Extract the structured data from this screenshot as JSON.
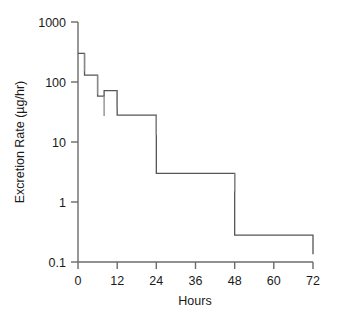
{
  "chart_data": {
    "type": "line",
    "plot_style": "step-post",
    "title": "",
    "subtitle": "",
    "xlabel": "Hours",
    "ylabel": "Excretion Rate (µg/hr)",
    "xlim": [
      0,
      72
    ],
    "ylim": [
      0.1,
      1000
    ],
    "yscale": "log",
    "xscale": "linear",
    "grid": false,
    "legend": null,
    "legend_position": "none",
    "xticks": [
      0,
      12,
      24,
      36,
      48,
      60,
      72
    ],
    "xtick_labels": [
      "0",
      "12",
      "24",
      "36",
      "48",
      "60",
      "72"
    ],
    "yticks": [
      0.1,
      1,
      10,
      100,
      1000
    ],
    "ytick_labels": [
      "0.1",
      "1",
      "10",
      "100",
      "1000"
    ],
    "line_color": "#555555",
    "axis_color": "#6b6b6b",
    "background": "#ffffff",
    "x": [
      0,
      2,
      6,
      8,
      12,
      24,
      48,
      72
    ],
    "intervals": [
      {
        "x_start": 0,
        "x_end": 2,
        "value": 300,
        "err_low": 150
      },
      {
        "x_start": 2,
        "x_end": 6,
        "value": 130,
        "err_low": 62
      },
      {
        "x_start": 6,
        "x_end": 8,
        "value": 58,
        "err_low": 27
      },
      {
        "x_start": 8,
        "x_end": 12,
        "value": 72,
        "err_low": 36
      },
      {
        "x_start": 12,
        "x_end": 24,
        "value": 28,
        "err_low": 13
      },
      {
        "x_start": 24,
        "x_end": 48,
        "value": 3.0,
        "err_low": 1.5
      },
      {
        "x_start": 48,
        "x_end": 72,
        "value": 0.28,
        "err_low": 0.135
      }
    ],
    "values": [
      300,
      130,
      58,
      72,
      28,
      3.0,
      0.28
    ],
    "error_low": [
      150,
      62,
      27,
      36,
      13,
      1.5,
      0.135
    ],
    "categories": [
      "0-2",
      "2-6",
      "6-8",
      "8-12",
      "12-24",
      "24-48",
      "48-72"
    ]
  },
  "axes": {
    "x_label": "Hours",
    "y_label": "Excretion Rate (µg/hr)"
  },
  "labels": {
    "y": {
      "t1000": "1000",
      "t100": "100",
      "t10": "10",
      "t1": "1",
      "t01": "0.1"
    },
    "x": {
      "t0": "0",
      "t12": "12",
      "t24": "24",
      "t36": "36",
      "t48": "48",
      "t60": "60",
      "t72": "72"
    }
  }
}
